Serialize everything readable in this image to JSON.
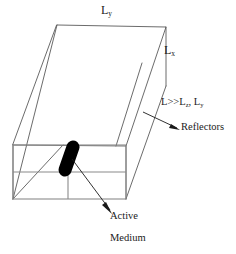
{
  "figure": {
    "background_color": "#ffffff",
    "line_color": "#5a5a5a",
    "front_face_line_color": "#8a8a8a",
    "active_medium_color": "#000000",
    "text_color": "#1a1a1a",
    "labels": {
      "length_y": {
        "base": "L",
        "sub": "y"
      },
      "length_x": {
        "base": "L",
        "sub": "x"
      },
      "inequality": {
        "lead": "L>>L",
        "sub1": "z",
        "mid": ", L",
        "sub2": "y"
      },
      "reflectors": "Reflectors",
      "active": "Active",
      "medium": "Medium"
    }
  }
}
